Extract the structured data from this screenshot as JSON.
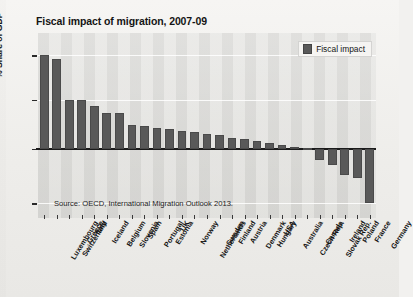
{
  "title": "Fiscal impact of migration, 2007-09",
  "legend": {
    "label": "Fiscal impact",
    "color": "#595959"
  },
  "source": "Source: OECD, International Migration Outlook 2013.",
  "ylabel": "% Share of GDP",
  "chart_data": {
    "type": "bar",
    "title": "Fiscal impact of migration, 2007-09",
    "xlabel": "",
    "ylabel": "% Share of GDP",
    "ylim": [
      -1.4,
      2.35
    ],
    "yticks": [
      1.9,
      1.0,
      0.0,
      -1.1
    ],
    "grid": true,
    "legend_position": "top-right",
    "series_name": "Fiscal impact",
    "categories": [
      "Luxembourg",
      "Switzerland",
      "Greece",
      "Italy",
      "Iceland",
      "Belgium",
      "Slovenia",
      "Spain",
      "Portugal",
      "Estonia",
      "UK",
      "Norway",
      "Netherlands",
      "Sweden",
      "Finland",
      "Austria",
      "Denmark",
      "Hungary",
      "USA",
      "Australia",
      "Czech Rep.",
      "Canada",
      "Slovak Rep.",
      "Ireland",
      "Poland",
      "France",
      "Germany"
    ],
    "values": [
      1.9,
      1.83,
      1.0,
      1.0,
      0.88,
      0.73,
      0.72,
      0.48,
      0.46,
      0.42,
      0.4,
      0.36,
      0.34,
      0.3,
      0.28,
      0.22,
      0.2,
      0.16,
      0.12,
      0.08,
      0.04,
      0.02,
      -0.22,
      -0.33,
      -0.52,
      -0.58,
      -1.1
    ]
  }
}
